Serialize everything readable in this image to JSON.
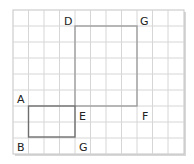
{
  "grid": {
    "columns": 11,
    "rows": 9,
    "line_color": "#d4d4d4",
    "border_color": "#bbbbbb",
    "shadow_color": "#cfcfcf"
  },
  "shapes": {
    "large_rectangle": {
      "vertices": [
        "D",
        "G",
        "F",
        "E"
      ],
      "grid_width": 4,
      "grid_height": 5,
      "stroke": "#9a9a9a"
    },
    "small_rectangle": {
      "vertices": [
        "A",
        "E",
        "G",
        "B"
      ],
      "grid_width": 3,
      "grid_height": 2,
      "stroke": "#6e6e6e"
    }
  },
  "labels": {
    "D": "D",
    "G_top": "G",
    "A": "A",
    "E": "E",
    "F": "F",
    "B": "B",
    "G_bottom": "G"
  }
}
